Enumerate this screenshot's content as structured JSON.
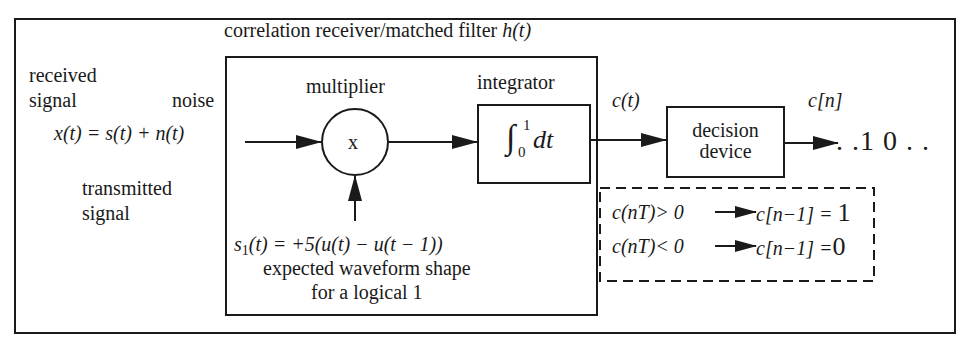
{
  "diagram": {
    "title": "correlation receiver/matched filter",
    "title_func": "h(t)",
    "inputs": {
      "received_signal_line1": "received",
      "received_signal_line2": "signal",
      "noise_label": "noise",
      "equation": "x(t) = s(t) + n(t)",
      "transmitted_line1": "transmitted",
      "transmitted_line2": "signal"
    },
    "multiplier": {
      "label": "multiplier",
      "symbol": "x"
    },
    "integrator": {
      "label": "integrator",
      "upper_limit": "1",
      "lower_limit": "0",
      "body": "dt",
      "integral_sign": "∫"
    },
    "reference": {
      "signal_name": "s",
      "signal_sub": "1",
      "equation": "(t) = +5(u(t) − u(t − 1))",
      "desc_line1": "expected waveform shape",
      "desc_line2": "for a logical 1"
    },
    "correlator_output": "c(t)",
    "decision": {
      "line1": "decision",
      "line2": "device",
      "output_label": "c[n]",
      "output_bits": ". .1 0 . ."
    },
    "rules": [
      {
        "condition": "c(nT)> 0",
        "result": "c[n−1] = ",
        "value": "1"
      },
      {
        "condition": "c(nT)< 0",
        "result": "c[n−1] =",
        "value": "0"
      }
    ],
    "colors": {
      "stroke": "#1a1a1a",
      "background": "#ffffff"
    }
  }
}
